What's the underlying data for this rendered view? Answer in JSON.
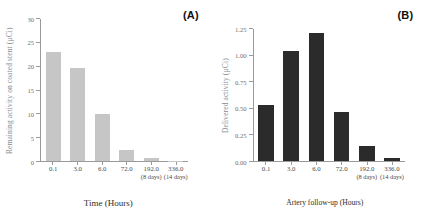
{
  "figure": {
    "panels": [
      {
        "tag": "(A)",
        "ylabel_line1": "Remaining activity on coated stent",
        "ylabel_line2": "(µCi)",
        "xlabel": "Time (Hours)"
      },
      {
        "tag": "(B)",
        "ylabel_line1": "Delivered activity (µCi)",
        "ylabel_line2": "",
        "xlabel": "Artery follow-up (Hours)"
      }
    ]
  },
  "chart_data": [
    {
      "type": "bar",
      "title": "(A)",
      "categories": [
        "0.1",
        "3.0",
        "6.0",
        "72.0",
        "192.0",
        "336.0"
      ],
      "category_sublabels": [
        "",
        "",
        "",
        "",
        "(8 days)",
        "(14 days)"
      ],
      "values": [
        23.0,
        19.7,
        9.9,
        2.4,
        0.6,
        0.1
      ],
      "xlabel": "Time (Hours)",
      "ylabel": "Remaining activity on coated stent (µCi)",
      "ylim": [
        0,
        30
      ],
      "yticks": [
        "0",
        "5",
        "10",
        "15",
        "20",
        "25",
        "30"
      ],
      "ytick_values": [
        0,
        5,
        10,
        15,
        20,
        25,
        30
      ],
      "grid": false,
      "legend": false,
      "bar_color": "#c6c6c6"
    },
    {
      "type": "bar",
      "title": "(B)",
      "categories": [
        "0.1",
        "3.0",
        "6.0",
        "72.0",
        "192.0",
        "336.0"
      ],
      "category_sublabels": [
        "",
        "",
        "",
        "",
        "(8 days)",
        "(14 days)"
      ],
      "values": [
        0.53,
        1.04,
        1.21,
        0.46,
        0.14,
        0.03
      ],
      "xlabel": "Artery follow-up (Hours)",
      "ylabel": "Delivered activity (µCi)",
      "ylim": [
        0,
        1.25
      ],
      "yticks": [
        "0.00",
        "0.25",
        "0.50",
        "0.75",
        "1.00",
        "1.25"
      ],
      "ytick_values": [
        0,
        0.25,
        0.5,
        0.75,
        1.0,
        1.25
      ],
      "grid": false,
      "legend": false,
      "bar_color": "#2b2b2b"
    }
  ]
}
